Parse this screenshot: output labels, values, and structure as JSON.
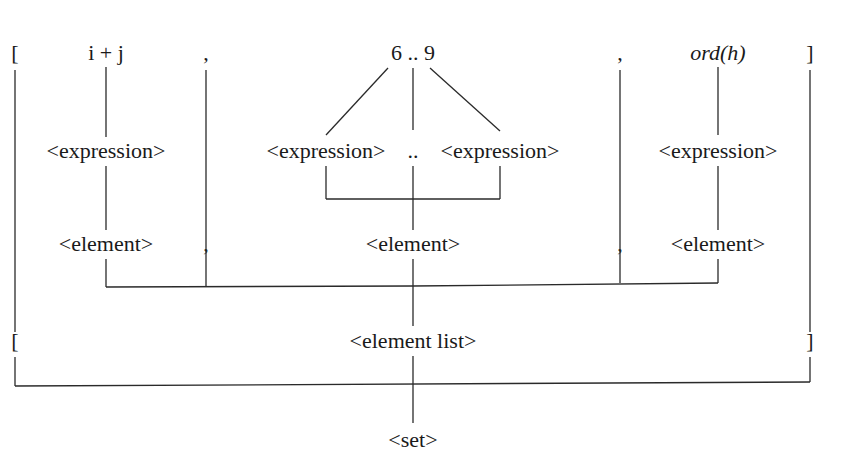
{
  "diagram": {
    "type": "parse-tree",
    "tokens": {
      "open_bracket": "[",
      "expr1": "i + j",
      "comma1": ",",
      "range": "6 .. 9",
      "comma2": ",",
      "expr3": "ord(h)",
      "close_bracket": "]"
    },
    "level_expression": {
      "expr1": "<expression>",
      "range_low": "<expression>",
      "range_dots": "..",
      "range_high": "<expression>",
      "expr3": "<expression>"
    },
    "level_element": {
      "element1": "<element>",
      "comma1": ",",
      "element2": "<element>",
      "comma2": ",",
      "element3": "<element>"
    },
    "level_list": {
      "open_bracket": "[",
      "element_list": "<element list>",
      "close_bracket": "]"
    },
    "root": "<set>"
  }
}
